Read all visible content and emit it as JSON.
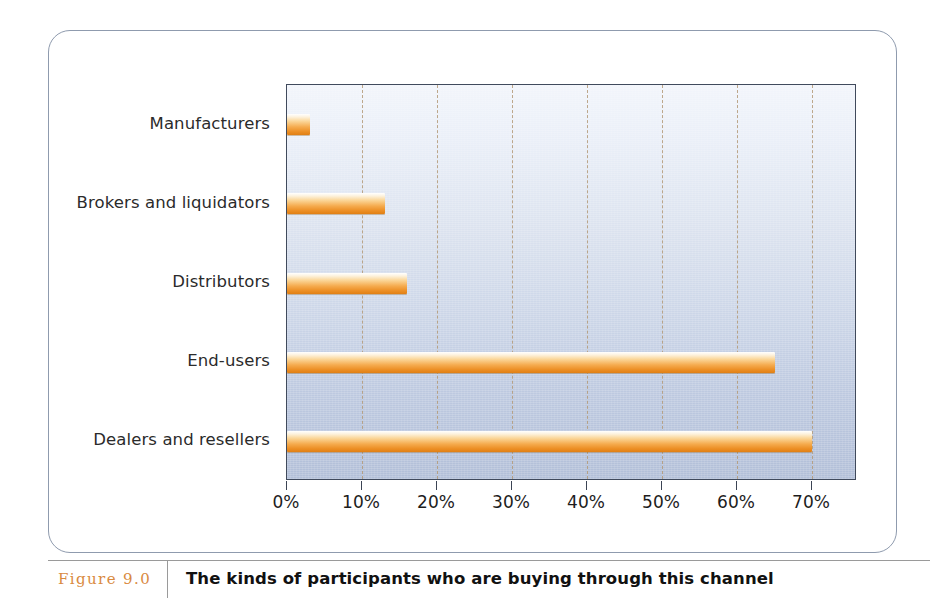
{
  "figure": {
    "number_label": "Figure 9.0",
    "caption": "The kinds of participants who are buying through this channel"
  },
  "colors": {
    "bar_highlight": "#ffffff",
    "bar_mid": "#f5ab4e",
    "bar_shadow": "#e07f14",
    "gridline": "#b49a78",
    "plot_border": "#404a5c",
    "plot_bg_top": "#f2f5fb",
    "plot_bg_bottom": "#b2bfd8",
    "card_border": "#8f9bae",
    "figure_number": "#d98a3f",
    "label_text": "#2b2b2b"
  },
  "chart_data": {
    "type": "bar",
    "orientation": "horizontal",
    "title": "",
    "xlabel": "",
    "ylabel": "",
    "categories": [
      "Manufacturers",
      "Brokers and liquidators",
      "Distributors",
      "End-users",
      "Dealers and resellers"
    ],
    "values": [
      3,
      13,
      16,
      65,
      70
    ],
    "value_suffix": "%",
    "xlim": [
      0,
      76
    ],
    "xticks": [
      0,
      10,
      20,
      30,
      40,
      50,
      60,
      70
    ],
    "xticklabels": [
      "0%",
      "10%",
      "20%",
      "30%",
      "40%",
      "50%",
      "60%",
      "70%"
    ],
    "grid": "vertical-dashed",
    "legend": "none"
  }
}
